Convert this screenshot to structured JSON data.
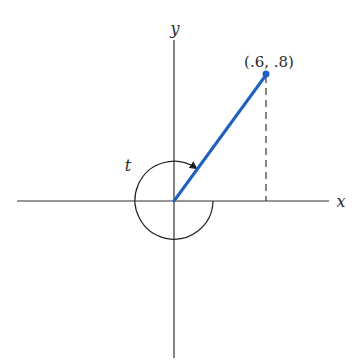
{
  "diagram": {
    "axes": {
      "x_label": "x",
      "y_label": "y"
    },
    "point": {
      "label": "(.6, .8)",
      "x": 0.6,
      "y": 0.8
    },
    "angle": {
      "label": "t"
    },
    "colors": {
      "segment": "#1f5fbf",
      "axes": "#333333",
      "background": "#ffffff"
    }
  }
}
